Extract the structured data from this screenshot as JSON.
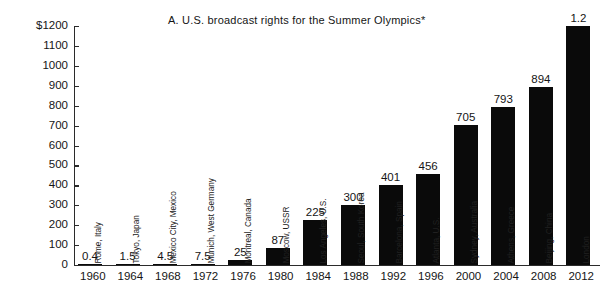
{
  "chart_data": {
    "type": "bar",
    "title": "A.  U.S. broadcast rights for the Summer Olympics*",
    "xlabel": "",
    "ylabel": "",
    "ylim": [
      0,
      1200
    ],
    "grid": false,
    "legend": "none",
    "y_unit_prefix": "$",
    "y_ticks": [
      0,
      100,
      200,
      300,
      400,
      500,
      600,
      700,
      800,
      900,
      1000,
      1100,
      1200
    ],
    "y_tick_labels": [
      "0",
      "100",
      "200",
      "300",
      "400",
      "500",
      "600",
      "700",
      "800",
      "900",
      "1000",
      "1100",
      "$1200"
    ],
    "categories": [
      "1960",
      "1964",
      "1968",
      "1972",
      "1976",
      "1980",
      "1984",
      "1988",
      "1992",
      "1996",
      "2000",
      "2004",
      "2008",
      "2012"
    ],
    "values": [
      0.4,
      1.5,
      4.5,
      7.5,
      25,
      87,
      225,
      300,
      401,
      456,
      705,
      793,
      894,
      1200
    ],
    "value_labels": [
      "0.4",
      "1.5",
      "4.5",
      "7.5",
      "25",
      "87",
      "225",
      "300",
      "401",
      "456",
      "705",
      "793",
      "894",
      "1.2"
    ],
    "point_annotations": [
      "Rome, Italy",
      "Tokyo, Japan",
      "Mexico City, Mexico",
      "Munich, West Germany",
      "Montreal, Canada",
      "Moscow, USSR",
      "Los Angeles, U.S.",
      "Seoul, South Korea",
      "Barcelona, Spain",
      "Atlanta, U.S.",
      "Sydney, Australia",
      "Athens, Greece",
      "Beijing, China",
      "London"
    ],
    "bar_color": "#0a0a0a",
    "axis_color": "#2b2b2b",
    "background": "#ffffff"
  }
}
